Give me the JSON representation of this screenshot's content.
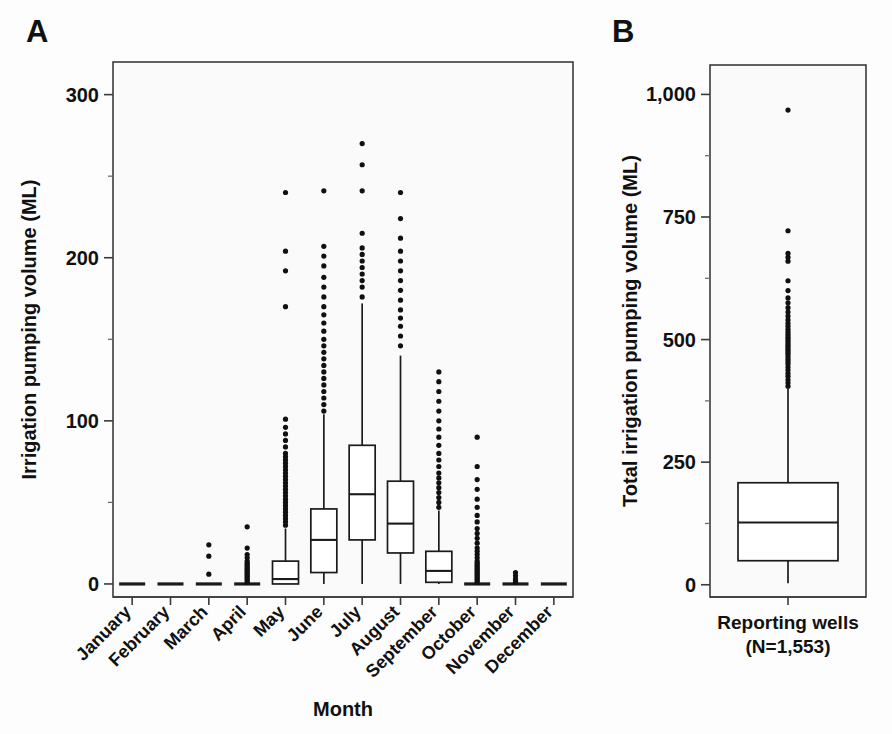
{
  "figure": {
    "panelA_letter": "A",
    "panelB_letter": "B"
  },
  "chart_data": [
    {
      "id": "panelA",
      "type": "box",
      "title": "A",
      "xlabel": "Month",
      "ylabel": "Irrigation pumping volume (ML)",
      "ylim": [
        -8,
        320
      ],
      "yticks": [
        0,
        100,
        200,
        300
      ],
      "ytick_labels": [
        "0",
        "100",
        "200",
        "300"
      ],
      "yminor": [
        50,
        150,
        250
      ],
      "grid": false,
      "legend": "none",
      "categories": [
        "January",
        "February",
        "March",
        "April",
        "May",
        "June",
        "July",
        "August",
        "September",
        "October",
        "November",
        "December"
      ],
      "boxes": [
        {
          "category": "January",
          "min": 0,
          "q1": 0,
          "median": 0,
          "q3": 0,
          "max": 0,
          "outliers": []
        },
        {
          "category": "February",
          "min": 0,
          "q1": 0,
          "median": 0,
          "q3": 0,
          "max": 0,
          "outliers": []
        },
        {
          "category": "March",
          "min": 0,
          "q1": 0,
          "median": 0,
          "q3": 0,
          "max": 0,
          "outliers": [
            6,
            17,
            24
          ]
        },
        {
          "category": "April",
          "min": 0,
          "q1": 0,
          "median": 0,
          "q3": 0,
          "max": 2,
          "outliers": [
            1,
            2,
            3,
            4,
            5,
            6,
            7,
            8,
            9,
            10,
            11,
            12,
            13,
            14,
            16,
            18,
            22,
            35
          ]
        },
        {
          "category": "May",
          "min": 0,
          "q1": 0,
          "median": 3,
          "q3": 14,
          "max": 34,
          "outliers": [
            36,
            38,
            40,
            42,
            44,
            46,
            48,
            50,
            52,
            54,
            56,
            58,
            60,
            62,
            64,
            66,
            68,
            70,
            72,
            74,
            76,
            78,
            80,
            84,
            88,
            92,
            96,
            101,
            170,
            192,
            204,
            240
          ]
        },
        {
          "category": "June",
          "min": 0,
          "q1": 7,
          "median": 27,
          "q3": 46,
          "max": 104,
          "outliers": [
            106,
            110,
            114,
            118,
            122,
            126,
            130,
            134,
            138,
            142,
            146,
            150,
            155,
            160,
            165,
            170,
            176,
            182,
            188,
            195,
            201,
            207,
            241
          ]
        },
        {
          "category": "July",
          "min": 0,
          "q1": 27,
          "median": 55,
          "q3": 85,
          "max": 172,
          "outliers": [
            176,
            182,
            186,
            190,
            194,
            198,
            202,
            206,
            215,
            241,
            257,
            270
          ]
        },
        {
          "category": "August",
          "min": 0,
          "q1": 19,
          "median": 37,
          "q3": 63,
          "max": 140,
          "outliers": [
            146,
            152,
            158,
            163,
            168,
            174,
            180,
            186,
            192,
            198,
            204,
            212,
            224,
            240
          ]
        },
        {
          "category": "September",
          "min": 0,
          "q1": 1,
          "median": 8,
          "q3": 20,
          "max": 45,
          "outliers": [
            47,
            50,
            53,
            56,
            59,
            62,
            65,
            68,
            72,
            76,
            80,
            85,
            90,
            95,
            100,
            106,
            112,
            118,
            124,
            130
          ]
        },
        {
          "category": "October",
          "min": 0,
          "q1": 0,
          "median": 0,
          "q3": 0,
          "max": 0,
          "outliers": [
            1,
            2,
            3,
            4,
            5,
            6,
            7,
            8,
            9,
            10,
            11,
            12,
            13,
            14,
            16,
            18,
            20,
            22,
            25,
            28,
            31,
            34,
            38,
            42,
            47,
            52,
            58,
            64,
            72,
            90
          ]
        },
        {
          "category": "November",
          "min": 0,
          "q1": 0,
          "median": 0,
          "q3": 0,
          "max": 0,
          "outliers": [
            1,
            2,
            3,
            5,
            7
          ]
        },
        {
          "category": "December",
          "min": 0,
          "q1": 0,
          "median": 0,
          "q3": 0,
          "max": 0,
          "outliers": []
        }
      ]
    },
    {
      "id": "panelB",
      "type": "box",
      "title": "B",
      "xlabel": "",
      "ylabel": "Total irrigation pumping volume (ML)",
      "ylim": [
        -25,
        1060
      ],
      "yticks": [
        0,
        250,
        500,
        750,
        1000
      ],
      "ytick_labels": [
        "0",
        "250",
        "500",
        "750",
        "1,000"
      ],
      "yminor": [
        125,
        375,
        625,
        875
      ],
      "grid": false,
      "legend": "none",
      "categories": [
        "Reporting wells"
      ],
      "category_sublabels": [
        "(N=1,553)"
      ],
      "boxes": [
        {
          "category": "Reporting wells",
          "min": 3,
          "q1": 49,
          "median": 127,
          "q3": 208,
          "max": 400,
          "outliers": [
            405,
            412,
            418,
            425,
            431,
            438,
            444,
            450,
            455,
            460,
            465,
            470,
            474,
            478,
            482,
            486,
            490,
            494,
            498,
            502,
            506,
            511,
            516,
            521,
            527,
            533,
            540,
            548,
            556,
            565,
            575,
            585,
            600,
            620,
            660,
            668,
            676,
            722,
            968
          ]
        }
      ]
    }
  ],
  "panelA": {
    "letter": "A",
    "ylabel": "Irrigation pumping volume (ML)",
    "xlabel": "Month",
    "ytick_labels": [
      "0",
      "100",
      "200",
      "300"
    ],
    "categories": [
      "January",
      "February",
      "March",
      "April",
      "May",
      "June",
      "July",
      "August",
      "September",
      "October",
      "November",
      "December"
    ]
  },
  "panelB": {
    "letter": "B",
    "ylabel": "Total irrigation pumping volume (ML)",
    "xlabel": "",
    "ytick_labels": [
      "0",
      "250",
      "500",
      "750",
      "1,000"
    ],
    "category_label": "Reporting wells",
    "category_sublabel": "(N=1,553)"
  },
  "colors": {
    "ink": "#101010",
    "frame": "#3b3b3b",
    "panel_bg": "#fafafa",
    "box_fill": "#ffffff"
  }
}
